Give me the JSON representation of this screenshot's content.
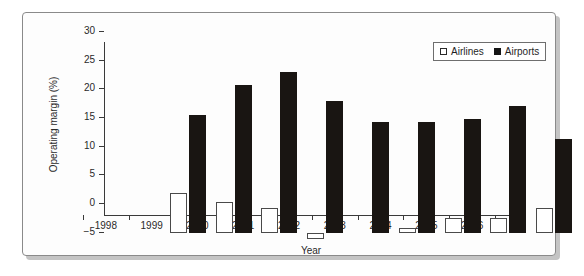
{
  "chart_data": {
    "type": "bar",
    "title": "",
    "xlabel": "Year",
    "ylabel": "Operating margin (%)",
    "categories": [
      "1998",
      "1999",
      "2000",
      "2001",
      "2002",
      "2003",
      "2004",
      "2005",
      "2006"
    ],
    "series": [
      {
        "name": "Airlines",
        "values": [
          6.9,
          5.4,
          4.3,
          -1.0,
          0.0,
          0.9,
          2.7,
          2.6,
          4.3
        ],
        "style": "open",
        "color": "#ffffff",
        "edge_color": "#4a4a4a"
      },
      {
        "name": "Airports",
        "values": [
          20.6,
          25.8,
          28.0,
          23.0,
          19.3,
          19.4,
          19.9,
          22.1,
          16.4
        ],
        "style": "filled",
        "color": "#191512",
        "edge_color": "#191512"
      }
    ],
    "ylim": [
      -5,
      30
    ],
    "yticks": [
      -5,
      0,
      5,
      10,
      15,
      20,
      25,
      30
    ],
    "ytick_labels": [
      "−5",
      "0",
      "5",
      "10",
      "15",
      "20",
      "25",
      "30"
    ],
    "grid": false,
    "legend_position": "top-right",
    "axis_color": "#3a3a3a"
  },
  "figure": {
    "border_color": "#8a8a8a",
    "background": "#fdfdfd",
    "shadow_color": "#b0b0b0"
  }
}
